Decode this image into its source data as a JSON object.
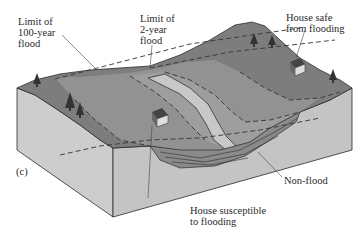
{
  "figure": {
    "panel_label": "(c)",
    "labels": {
      "limit_100": "Limit of\n100-year\nflood",
      "limit_2": "Limit of\n2-year\nflood",
      "house_safe": "House safe\nfrom flooding",
      "non_flood": "Non-flood",
      "house_susceptible": "House susceptible\nto flooding"
    },
    "colors": {
      "block_face": "#c9c9c9",
      "block_face_dark": "#b4b4b4",
      "upland": "#7a7a7a",
      "floodplain": "#8e8e8e",
      "channel": "#bdbdbd",
      "outline": "#2b2b2b"
    }
  }
}
